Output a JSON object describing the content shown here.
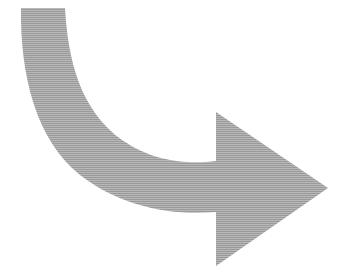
{
  "canvas": {
    "width": 346,
    "height": 279,
    "background_color": "#ffffff",
    "alt_text": "Curved arrow bending clockwise from upper left and pointing right"
  },
  "graphic": {
    "name": "curved-arrow",
    "fill_color": "#9a9a9a",
    "stroke": "none",
    "direction": "right",
    "style": "solid flat fill with faint horizontal scanline texture",
    "path": "M 21 8 L 65 8 C 68 60 80 110 122 140 C 155 163 190 164 216 161 L 216 112 L 328 188 L 216 266 L 216 212 C 170 216 120 206 80 175 C 36 140 20 75 21 8 Z",
    "geometry": {
      "tail_top_left": [
        21,
        8
      ],
      "tail_top_right": [
        65,
        8
      ],
      "arrowhead_back_top": [
        216,
        112
      ],
      "arrowhead_tip": [
        328,
        188
      ],
      "arrowhead_back_bottom": [
        216,
        266
      ],
      "notch_top": [
        216,
        161
      ],
      "notch_bottom": [
        216,
        212
      ],
      "band_thickness_px": 50
    }
  },
  "texture": {
    "name": "scanline-overlay",
    "line_spacing_px": 2,
    "line_color": "rgba(255,255,255,0.30)"
  }
}
